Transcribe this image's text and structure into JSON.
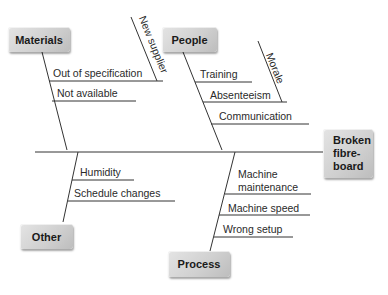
{
  "diagram": {
    "type": "fishbone",
    "effect": {
      "label_lines": [
        "Broken",
        "fibre-",
        "board"
      ]
    },
    "categories": [
      {
        "name": "Materials",
        "causes": [
          "Out of specification",
          "Not available"
        ],
        "sub_causes": {
          "Out of specification": [
            "New supplier"
          ]
        }
      },
      {
        "name": "People",
        "causes": [
          "Training",
          "Absenteeism",
          "Communication"
        ],
        "sub_causes": {
          "Absenteeism": [
            "Morale"
          ]
        }
      },
      {
        "name": "Other",
        "causes": [
          "Humidity",
          "Schedule changes"
        ]
      },
      {
        "name": "Process",
        "causes": [
          "Machine maintenance",
          "Machine speed",
          "Wrong setup"
        ],
        "cause_display": {
          "Machine maintenance": [
            "Machine",
            "maintenance"
          ]
        }
      }
    ],
    "colors": {
      "box_fill": "#cfcfcf",
      "line": "#333333",
      "text": "#222222"
    }
  }
}
